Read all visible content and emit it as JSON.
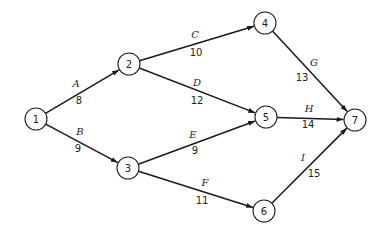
{
  "diagram": {
    "type": "directed-network",
    "nodes": [
      {
        "id": "1",
        "label": "1",
        "x": 36,
        "y": 119
      },
      {
        "id": "2",
        "label": "2",
        "x": 129,
        "y": 64
      },
      {
        "id": "3",
        "label": "3",
        "x": 128,
        "y": 168
      },
      {
        "id": "4",
        "label": "4",
        "x": 265,
        "y": 23
      },
      {
        "id": "5",
        "label": "5",
        "x": 266,
        "y": 117
      },
      {
        "id": "6",
        "label": "6",
        "x": 264,
        "y": 211
      },
      {
        "id": "7",
        "label": "7",
        "x": 355,
        "y": 120
      }
    ],
    "edges": [
      {
        "name": "A",
        "weight": "8",
        "from": "1",
        "to": "2",
        "lx": 76,
        "ly": 83,
        "wx": 79,
        "wy": 100
      },
      {
        "name": "B",
        "weight": "9",
        "from": "1",
        "to": "3",
        "lx": 80,
        "ly": 131,
        "wx": 78,
        "wy": 148
      },
      {
        "name": "C",
        "weight": "10",
        "from": "2",
        "to": "4",
        "lx": 195,
        "ly": 34,
        "wx": 196,
        "wy": 52
      },
      {
        "name": "D",
        "weight": "12",
        "from": "2",
        "to": "5",
        "lx": 197,
        "ly": 82,
        "wx": 197,
        "wy": 100
      },
      {
        "name": "E",
        "weight": "9",
        "from": "3",
        "to": "5",
        "lx": 193,
        "ly": 134,
        "wx": 195,
        "wy": 150
      },
      {
        "name": "F",
        "weight": "11",
        "from": "3",
        "to": "6",
        "lx": 205,
        "ly": 182,
        "wx": 202,
        "wy": 200
      },
      {
        "name": "G",
        "weight": "13",
        "from": "4",
        "to": "7",
        "lx": 314,
        "ly": 62,
        "wx": 302,
        "wy": 77
      },
      {
        "name": "H",
        "weight": "14",
        "from": "5",
        "to": "7",
        "lx": 309,
        "ly": 108,
        "wx": 308,
        "wy": 124
      },
      {
        "name": "I",
        "weight": "15",
        "from": "6",
        "to": "7",
        "lx": 303,
        "ly": 157,
        "wx": 314,
        "wy": 173
      }
    ],
    "node_radius": 11,
    "colors": {
      "stroke": "#1a1a1a",
      "background": "#ffffff"
    }
  }
}
